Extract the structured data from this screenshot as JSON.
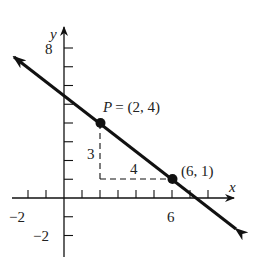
{
  "axes": {
    "x_label": "x",
    "y_label": "y",
    "x_tick_labels": [
      {
        "value": -2,
        "text": "−2"
      },
      {
        "value": 6,
        "text": "6"
      }
    ],
    "y_tick_labels": [
      {
        "value": 8,
        "text": "8"
      },
      {
        "value": -2,
        "text": "−2"
      }
    ],
    "x_range": [
      -3,
      9
    ],
    "y_range": [
      -3,
      9
    ]
  },
  "line": {
    "description": "Line through P(2,4) and (6,1)",
    "slope": "-3/4"
  },
  "points": [
    {
      "label": "P = (2, 4)",
      "x": 2,
      "y": 4
    },
    {
      "label": "(6, 1)",
      "x": 6,
      "y": 1
    }
  ],
  "rise_run": {
    "rise_label": "3",
    "run_label": "4"
  },
  "colors": {
    "ink": "#111111",
    "background": "#ffffff"
  }
}
